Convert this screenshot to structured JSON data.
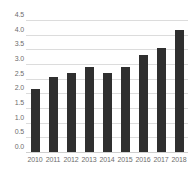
{
  "chart_data": {
    "type": "bar",
    "title": "",
    "subtitle": "",
    "xlabel": "",
    "ylabel": "",
    "categories": [
      "2010",
      "2011",
      "2012",
      "2013",
      "2014",
      "2015",
      "2016",
      "2017",
      "2018"
    ],
    "values": [
      2.15,
      2.55,
      2.7,
      2.9,
      2.7,
      2.9,
      3.3,
      3.55,
      4.15
    ],
    "series": [
      {
        "name": "",
        "values": [
          2.15,
          2.55,
          2.7,
          2.9,
          2.7,
          2.9,
          3.3,
          3.55,
          4.15
        ]
      }
    ],
    "ylim": [
      0.0,
      4.5
    ],
    "y_ticks": [
      0.0,
      0.5,
      1.0,
      1.5,
      2.0,
      2.5,
      3.0,
      3.5,
      4.0,
      4.5
    ],
    "y_tick_labels": [
      "0.0",
      "0.5",
      "1.0",
      "1.5",
      "2.0",
      "2.5",
      "3.0",
      "3.5",
      "4.0",
      "4.5"
    ],
    "x_tick_labels": [
      "2010",
      "2011",
      "2012",
      "2013",
      "2014",
      "2015",
      "2016",
      "2017",
      "2018"
    ],
    "grid": true,
    "grid_axis": "y",
    "legend": false,
    "legend_position": "none",
    "annotations": [],
    "colors": {
      "bar": "#2f2f2f",
      "gridline": "#dcdcdc",
      "baseline": "#cfcfcf",
      "tick_label": "#6d6d6d",
      "background": "#ffffff"
    }
  }
}
